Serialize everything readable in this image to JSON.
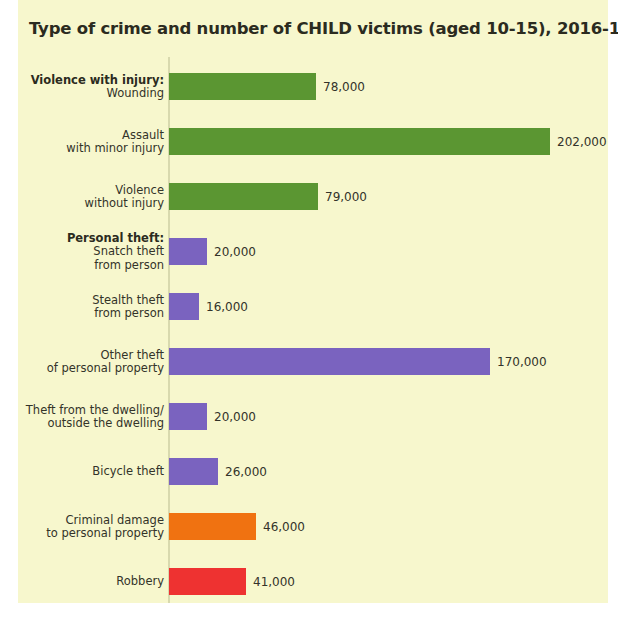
{
  "figure": {
    "title": "Type of crime and number of CHILD victims (aged 10-15), 2016-17",
    "background_color": "#f7f7cd",
    "axis_color": "#d8d9ae"
  },
  "chart_data": {
    "type": "bar",
    "orientation": "horizontal",
    "title": "Type of crime and number of CHILD victims (aged 10-15), 2016-17",
    "xlabel": "",
    "ylabel": "",
    "xlim": [
      0,
      202000
    ],
    "grid": false,
    "legend": null,
    "categories": [
      "Wounding",
      "Assault with minor injury",
      "Violence without injury",
      "Snatch theft from person",
      "Stealth theft from person",
      "Other theft of personal property",
      "Theft from the dwelling/ outside the dwelling",
      "Bicycle theft",
      "Criminal damage to personal property",
      "Robbery"
    ],
    "values": [
      78000,
      202000,
      79000,
      20000,
      16000,
      170000,
      20000,
      26000,
      46000,
      41000
    ],
    "value_labels": [
      "78,000",
      "202,000",
      "79,000",
      "20,000",
      "16,000",
      "170,000",
      "20,000",
      "26,000",
      "46,000",
      "41,000"
    ],
    "group_headings": [
      "Violence with injury:",
      "Personal theft:"
    ],
    "colors": {
      "violence": "#5b9632",
      "theft": "#7a63bf",
      "criminal_damage": "#f07211",
      "robbery": "#ee3231"
    },
    "bars": [
      {
        "group_head": "Violence with injury:",
        "label": "Wounding",
        "value": 78000,
        "value_label": "78,000",
        "color": "#5b9632"
      },
      {
        "group_head": "",
        "label": "Assault\nwith minor injury",
        "value": 202000,
        "value_label": "202,000",
        "color": "#5b9632"
      },
      {
        "group_head": "",
        "label": "Violence\nwithout injury",
        "value": 79000,
        "value_label": "79,000",
        "color": "#5b9632"
      },
      {
        "group_head": "Personal theft:",
        "label": "Snatch theft\nfrom person",
        "value": 20000,
        "value_label": "20,000",
        "color": "#7a63bf"
      },
      {
        "group_head": "",
        "label": "Stealth theft\nfrom person",
        "value": 16000,
        "value_label": "16,000",
        "color": "#7a63bf"
      },
      {
        "group_head": "",
        "label": "Other theft\nof personal property",
        "value": 170000,
        "value_label": "170,000",
        "color": "#7a63bf"
      },
      {
        "group_head": "",
        "label": "Theft from the dwelling/\noutside the dwelling",
        "value": 20000,
        "value_label": "20,000",
        "color": "#7a63bf"
      },
      {
        "group_head": "",
        "label": "Bicycle theft",
        "value": 26000,
        "value_label": "26,000",
        "color": "#7a63bf"
      },
      {
        "group_head": "",
        "label": "Criminal damage\nto personal property",
        "value": 46000,
        "value_label": "46,000",
        "color": "#f07211"
      },
      {
        "group_head": "",
        "label": "Robbery",
        "value": 41000,
        "value_label": "41,000",
        "color": "#ee3231"
      }
    ]
  }
}
